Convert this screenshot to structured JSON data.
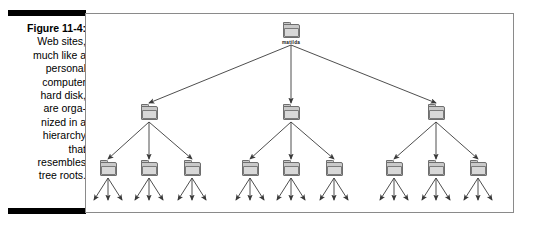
{
  "figure": {
    "label": "Figure 11-4:",
    "caption_lines": [
      "Web sites,",
      "much like a",
      "personal",
      "computer",
      "hard disk,",
      "are orga-",
      "nized in a",
      "hierarchy",
      "that",
      "resembles",
      "tree roots."
    ],
    "rule_color": "#000000",
    "frame_color": "#8a8a8a"
  },
  "diagram": {
    "type": "tree",
    "root": {
      "label": "matilda",
      "x": 205,
      "y": 10,
      "icon": "folder-icon"
    },
    "level2": [
      {
        "label": "",
        "x": 63,
        "y": 92,
        "icon": "folder-icon"
      },
      {
        "label": "",
        "x": 205,
        "y": 92,
        "icon": "folder-icon"
      },
      {
        "label": "",
        "x": 350,
        "y": 92,
        "icon": "folder-icon"
      }
    ],
    "level3": [
      {
        "x": 22,
        "y": 148,
        "icon": "folder-icon"
      },
      {
        "x": 63,
        "y": 148,
        "icon": "folder-icon"
      },
      {
        "x": 106,
        "y": 148,
        "icon": "folder-icon"
      },
      {
        "x": 164,
        "y": 148,
        "icon": "folder-icon"
      },
      {
        "x": 205,
        "y": 148,
        "icon": "folder-icon"
      },
      {
        "x": 248,
        "y": 148,
        "icon": "folder-icon"
      },
      {
        "x": 308,
        "y": 148,
        "icon": "folder-icon"
      },
      {
        "x": 350,
        "y": 148,
        "icon": "folder-icon"
      },
      {
        "x": 392,
        "y": 148,
        "icon": "folder-icon"
      }
    ],
    "leaf_arrows_per_node": 3,
    "edge_color": "#3a3a3a",
    "folder_fill": "#c9c9c9",
    "folder_stroke": "#6e6e6e"
  }
}
